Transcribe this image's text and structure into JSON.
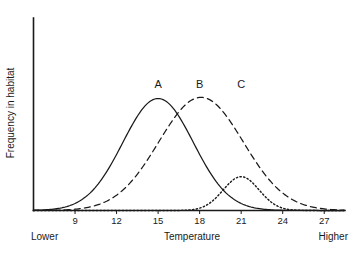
{
  "chart_data": {
    "type": "line",
    "title": "",
    "subtitle": "",
    "xlabel": "Temperature",
    "ylabel": "Frequency in habitat",
    "xlim": [
      6,
      28.5
    ],
    "ylim": [
      0,
      1.05
    ],
    "grid": false,
    "legend": "inline-curve-labels",
    "x_ticks": [
      "9",
      "12",
      "15",
      "18",
      "21",
      "24",
      "27"
    ],
    "x_tick_values": [
      9,
      12,
      15,
      18,
      21,
      24,
      27
    ],
    "y_ticks": [],
    "axis_end_labels": {
      "left": "Lower",
      "right": "Higher"
    },
    "annotations": [
      {
        "text": "A",
        "x": 15.0,
        "y": 1.02
      },
      {
        "text": "B",
        "x": 18.0,
        "y": 1.02
      },
      {
        "text": "C",
        "x": 21.0,
        "y": 1.02
      }
    ],
    "series": [
      {
        "name": "A",
        "label": "A",
        "style": "solid",
        "color": "#1a1a1a",
        "peak_x": 15.0,
        "peak_y": 0.96,
        "sigma": 2.55,
        "x": [
          6.0,
          7.0,
          8.0,
          9.0,
          10.0,
          11.0,
          12.0,
          13.0,
          14.0,
          15.0,
          16.0,
          17.0,
          18.0,
          19.0,
          20.0,
          21.0,
          22.0,
          23.0,
          24.0,
          25.0
        ],
        "values": [
          0.03,
          0.06,
          0.11,
          0.19,
          0.31,
          0.46,
          0.63,
          0.79,
          0.92,
          0.96,
          0.92,
          0.79,
          0.63,
          0.46,
          0.31,
          0.19,
          0.11,
          0.06,
          0.03,
          0.01
        ]
      },
      {
        "name": "B",
        "label": "B",
        "style": "dashed",
        "color": "#1a1a1a",
        "peak_x": 18.1,
        "peak_y": 0.97,
        "sigma": 3.05,
        "x": [
          8.0,
          9.0,
          10.0,
          11.0,
          12.0,
          13.0,
          14.0,
          15.0,
          16.0,
          17.0,
          18.0,
          19.0,
          20.0,
          21.0,
          22.0,
          23.0,
          24.0,
          25.0,
          26.0,
          27.0,
          28.0
        ],
        "values": [
          0.02,
          0.04,
          0.07,
          0.12,
          0.2,
          0.31,
          0.46,
          0.62,
          0.79,
          0.92,
          0.97,
          0.94,
          0.83,
          0.67,
          0.5,
          0.34,
          0.21,
          0.12,
          0.06,
          0.03,
          0.01
        ]
      },
      {
        "name": "C",
        "label": "C",
        "style": "dotted",
        "color": "#1a1a1a",
        "peak_x": 21.0,
        "peak_y": 0.29,
        "sigma": 1.3,
        "x": [
          17.5,
          18.0,
          18.5,
          19.0,
          19.5,
          20.0,
          20.5,
          21.0,
          21.5,
          22.0,
          22.5,
          23.0,
          23.5,
          24.0,
          24.5,
          25.0
        ],
        "values": [
          0.01,
          0.02,
          0.04,
          0.07,
          0.13,
          0.21,
          0.27,
          0.29,
          0.27,
          0.21,
          0.13,
          0.07,
          0.04,
          0.02,
          0.01,
          0.0
        ]
      }
    ]
  }
}
